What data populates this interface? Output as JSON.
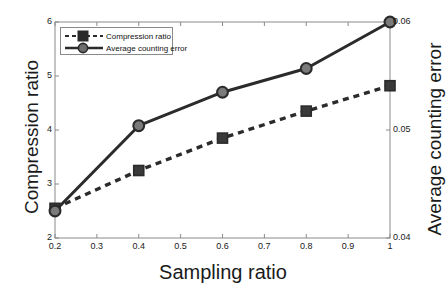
{
  "chart_data": {
    "type": "line",
    "title": "",
    "subtitle": "",
    "xlabel": "Sampling ratio",
    "ylabel": "Compression ratio",
    "ylabel_right": "Average counting error",
    "x": [
      0.2,
      0.4,
      0.6,
      0.8,
      1.0
    ],
    "xlim": [
      0.2,
      1.0
    ],
    "ylim": [
      2,
      6
    ],
    "ylim_right": [
      0.04,
      0.06
    ],
    "xticks": [
      "0.2",
      "0.3",
      "0.4",
      "0.5",
      "0.6",
      "0.7",
      "0.8",
      "0.9",
      "1"
    ],
    "xtick_values": [
      0.2,
      0.3,
      0.4,
      0.5,
      0.6,
      0.7,
      0.8,
      0.9,
      1.0
    ],
    "yticks_left": [
      "2",
      "3",
      "4",
      "5",
      "6"
    ],
    "ytick_left_values": [
      2,
      3,
      4,
      5,
      6
    ],
    "yticks_right": [
      "0.04",
      "0.05",
      "0.06"
    ],
    "ytick_right_values": [
      0.04,
      0.05,
      0.06
    ],
    "grid": false,
    "legend_position": "upper left",
    "series": [
      {
        "name": "Compression ratio",
        "axis": "left",
        "linestyle": "dashed",
        "marker": "square",
        "color": "#2b2b2b",
        "values": [
          2.55,
          3.25,
          3.85,
          4.35,
          4.82
        ]
      },
      {
        "name": "Average counting error",
        "axis": "right",
        "linestyle": "solid",
        "marker": "circle",
        "color": "#2b2b2b",
        "values": [
          0.0425,
          0.0504,
          0.0535,
          0.0557,
          0.06
        ]
      }
    ]
  },
  "legend": {
    "items": [
      {
        "label": "Compression ratio"
      },
      {
        "label": "Average counting error"
      }
    ]
  },
  "axes": {
    "x_title": "Sampling ratio",
    "y_left_title": "Compression ratio",
    "y_right_title": "Average counting error"
  },
  "colors": {
    "line": "#2b2b2b",
    "axis": "#8a8a8a",
    "text": "#1a1a1a",
    "background": "#ffffff"
  }
}
